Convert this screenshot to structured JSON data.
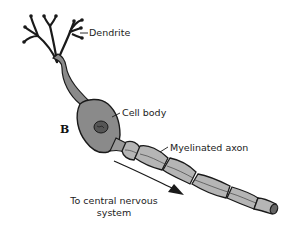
{
  "diagram": {
    "panel_letter": "B",
    "labels": {
      "dendrite": "Dendrite",
      "cell_body": "Cell body",
      "axon": "Myelinated axon",
      "direction_line1": "To central nervous",
      "direction_line2": "system"
    },
    "colors": {
      "outline": "#1a1a1a",
      "neuron_fill": "#8a8a8a",
      "myelin_fill": "#b5b5b5",
      "background": "#ffffff"
    }
  }
}
